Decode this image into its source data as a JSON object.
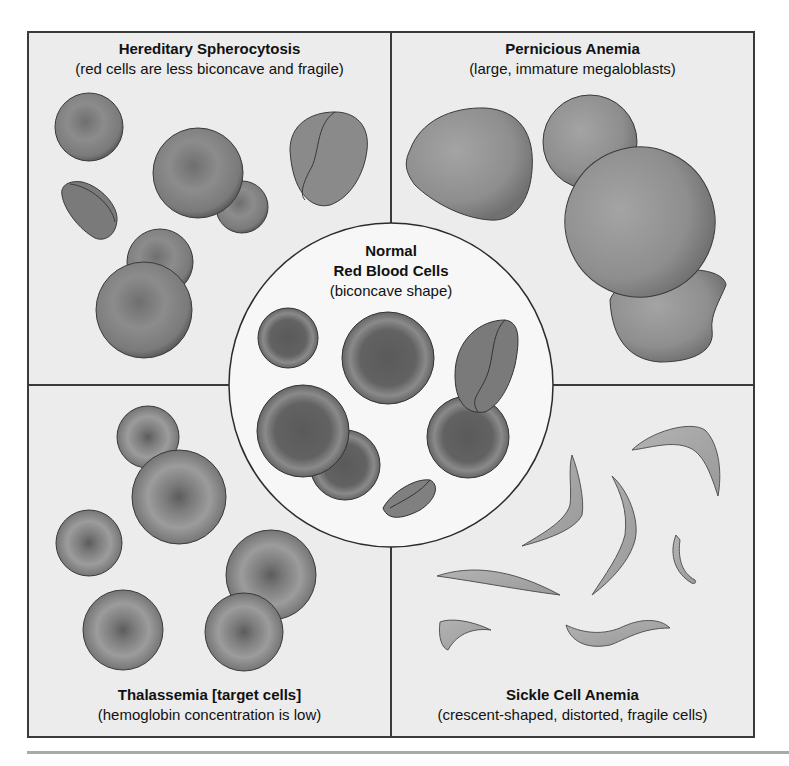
{
  "diagram": {
    "quadrants": {
      "top_left": {
        "title": "Hereditary Spherocytosis",
        "subtitle": "(red cells are less biconcave and fragile)"
      },
      "top_right": {
        "title": "Pernicious Anemia",
        "subtitle": "(large, immature megaloblasts)"
      },
      "bottom_left": {
        "title": "Thalassemia [target cells]",
        "subtitle": "(hemoglobin concentration is low)"
      },
      "bottom_right": {
        "title": "Sickle Cell Anemia",
        "subtitle": "(crescent-shaped, distorted, fragile cells)"
      }
    },
    "center": {
      "title_line1": "Normal",
      "title_line2": "Red Blood Cells",
      "subtitle": "(biconcave shape)"
    },
    "colors": {
      "panel_background": "#ececec",
      "border": "#3a3a3a",
      "center_background": "#f7f7f7",
      "cell_dark": "#5e5e5e",
      "cell_mid": "#8a8a8a",
      "sickle_fill": "#a8a8a8"
    }
  }
}
